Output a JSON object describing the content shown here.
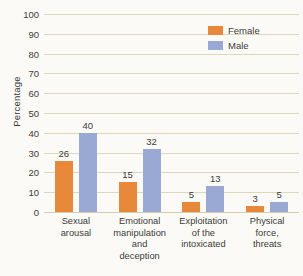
{
  "chart_data": {
    "type": "bar",
    "title": "",
    "xlabel": "",
    "ylabel": "Percentage",
    "ylim": [
      0,
      100
    ],
    "ytick_step": 10,
    "yticks": [
      0,
      10,
      20,
      30,
      40,
      50,
      60,
      70,
      80,
      90,
      100
    ],
    "grid": true,
    "legend_position": "top-right",
    "categories": [
      "Sexual arousal",
      "Emotional manipulation and deception",
      "Exploitation of the intoxicated",
      "Physical force, threats"
    ],
    "category_lines": [
      [
        "Sexual",
        "arousal"
      ],
      [
        "Emotional",
        "manipulation",
        "and",
        "deception"
      ],
      [
        "Exploitation",
        "of the",
        "intoxicated"
      ],
      [
        "Physical",
        "force,",
        "threats"
      ]
    ],
    "series": [
      {
        "name": "Female",
        "color": "#e8883a",
        "values": [
          26,
          15,
          5,
          3
        ]
      },
      {
        "name": "Male",
        "color": "#9aa8d4",
        "values": [
          40,
          32,
          13,
          5
        ]
      }
    ]
  },
  "legend": {
    "items": [
      {
        "label": "Female",
        "color": "#e8883a"
      },
      {
        "label": "Male",
        "color": "#9aa8d4"
      }
    ]
  },
  "colors": {
    "female": "#e8883a",
    "male": "#9aa8d4",
    "gridline": "#d9d9bc",
    "text": "#3b3b3b",
    "background": "#fbfaf6"
  }
}
